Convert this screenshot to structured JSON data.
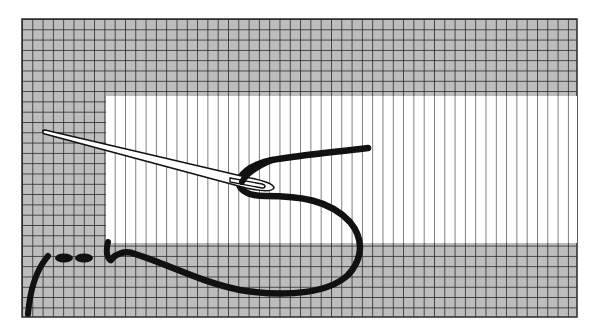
{
  "illustration": {
    "title": "Needlework stitch diagram",
    "colors": {
      "background": "#ffffff",
      "fabric_worked": "#bdbdbd",
      "grid_line": "#2a2a2a",
      "canvas_line": "#4a4a4a",
      "thread": "#111111",
      "needle_fill": "#ffffff",
      "needle_outline": "#111111"
    },
    "canvas": {
      "x": 22,
      "y": 19,
      "width": 555,
      "height": 298,
      "cell": 10.3
    },
    "unworked_area": {
      "x": 106,
      "y": 96,
      "width": 471,
      "height": 147
    },
    "elements": [
      {
        "name": "worked-stitches-grid",
        "label": "Worked area (grid)"
      },
      {
        "name": "unworked-canvas",
        "label": "Unworked canvas (vertical threads)"
      },
      {
        "name": "needle",
        "label": "Needle"
      },
      {
        "name": "yarn",
        "label": "Yarn"
      }
    ]
  }
}
